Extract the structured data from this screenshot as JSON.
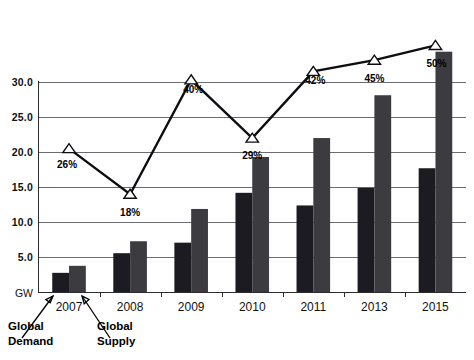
{
  "chart_data": {
    "type": "bar",
    "title": "",
    "subtitle": "",
    "xlabel": "",
    "ylabel": "GW",
    "ylim": [
      0,
      35
    ],
    "yticks": [
      5.0,
      10.0,
      15.0,
      20.0,
      25.0,
      30.0
    ],
    "ytick_labels": [
      "5.0",
      "10.0",
      "15.0",
      "20.0",
      "25.0",
      "30.0"
    ],
    "unit_label": "GW",
    "grid": true,
    "legend_position": "annotated-callouts",
    "categories": [
      "2007",
      "2008",
      "2009",
      "2010",
      "2011",
      "2013",
      "2015"
    ],
    "series": [
      {
        "name": "Global Demand",
        "type": "bar",
        "color": "#1b1b21",
        "values": [
          2.8,
          5.6,
          7.1,
          14.2,
          12.4,
          14.9,
          17.7
        ]
      },
      {
        "name": "Global Supply",
        "type": "bar",
        "color": "#3b3b40",
        "values": [
          3.8,
          7.3,
          11.9,
          19.3,
          22.0,
          28.1,
          34.3
        ]
      },
      {
        "name": "Overcapacity",
        "type": "line",
        "color": "#0d0d12",
        "marker": "triangle-open",
        "values": [
          20.5,
          14.0,
          30.3,
          22.0,
          31.5,
          33.1,
          35.2
        ],
        "data_labels": [
          "26%",
          "18%",
          "40%",
          "29%",
          "42%",
          "45%",
          "50%"
        ]
      }
    ],
    "annotations": [
      {
        "name": "global-demand-callout",
        "text_line1": "Global",
        "text_line2": "Demand",
        "points_to": "2007 dark bar"
      },
      {
        "name": "global-supply-callout",
        "text_line1": "Global",
        "text_line2": "Supply",
        "points_to": "2007 gray bar"
      }
    ],
    "colors": {
      "demand_bar": "#1b1b21",
      "supply_bar": "#3b3b40",
      "line": "#0d0d12",
      "gridline": "#5b5b63",
      "background": "#ffffff"
    }
  }
}
